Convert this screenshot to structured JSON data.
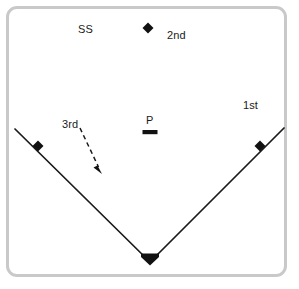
{
  "figure": {
    "name": "baseball-infield-diagram",
    "background_color": "#ffffff",
    "border_color": "#c9c9c9",
    "line_color": "#1a1a1a"
  },
  "labels": {
    "shortstop": "SS",
    "second_base": "2nd",
    "first_base": "1st",
    "pitcher": "P",
    "third_base": "3rd"
  },
  "diagram_data": {
    "type": "diagram",
    "subject": "baseball infield",
    "foul_lines": [
      {
        "name": "left-foul-line",
        "from": [
          15,
          129
        ],
        "to": [
          150,
          262
        ]
      },
      {
        "name": "right-foul-line",
        "from": [
          150,
          262
        ],
        "to": [
          284,
          128
        ]
      }
    ],
    "markers": [
      {
        "name": "second-base-marker",
        "shape": "diamond",
        "x": 148,
        "y": 28,
        "size": 9
      },
      {
        "name": "third-base-marker",
        "shape": "diamond",
        "x": 38,
        "y": 146,
        "size": 9
      },
      {
        "name": "first-base-marker",
        "shape": "diamond",
        "x": 260,
        "y": 146,
        "size": 9
      },
      {
        "name": "home-plate-marker",
        "shape": "home-plate",
        "x": 150,
        "y": 262,
        "size": 14
      },
      {
        "name": "pitchers-rubber",
        "shape": "rectangle",
        "x": 150,
        "y": 132,
        "width": 15,
        "height": 4
      }
    ],
    "arrow": {
      "name": "third-base-runner-path",
      "style": "dashed",
      "from": [
        80,
        128
      ],
      "to": [
        101,
        173
      ],
      "head": "filled-triangle"
    }
  }
}
